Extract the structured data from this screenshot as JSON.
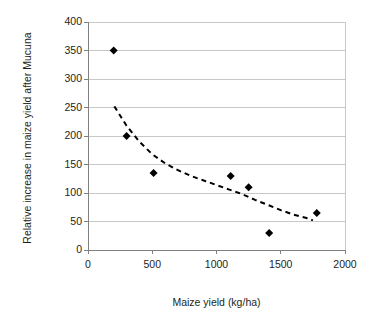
{
  "chart_data": {
    "type": "scatter",
    "title": "",
    "xlabel": "Maize yield (kg/ha)",
    "ylabel": "Relative increase in maize yield after Mucuna",
    "xlim": [
      0,
      2000
    ],
    "ylim": [
      0,
      400
    ],
    "xticks": [
      0,
      500,
      1000,
      1500,
      2000
    ],
    "yticks": [
      0,
      50,
      100,
      150,
      200,
      250,
      300,
      350,
      400
    ],
    "xtick_labels": [
      "0",
      "500",
      "1000",
      "1500",
      "2000"
    ],
    "ytick_labels": [
      "0",
      "50",
      "100",
      "150",
      "200",
      "250",
      "300",
      "350",
      "400"
    ],
    "grid": {
      "horizontal": true,
      "vertical": false,
      "color": "#c8c8c8"
    },
    "legend": {
      "visible": false,
      "position": "none"
    },
    "marker": {
      "shape": "diamond",
      "color": "#000000",
      "size": 7
    },
    "series": [
      {
        "name": "Relative increase in maize yield after Mucuna",
        "marker": "diamond",
        "color": "#000000",
        "points": [
          {
            "x": 200,
            "y": 350
          },
          {
            "x": 300,
            "y": 200
          },
          {
            "x": 510,
            "y": 135
          },
          {
            "x": 1110,
            "y": 130
          },
          {
            "x": 1250,
            "y": 110
          },
          {
            "x": 1410,
            "y": 30
          },
          {
            "x": 1780,
            "y": 65
          }
        ]
      }
    ],
    "trendline": {
      "name": "power-trendline",
      "style": "dashed",
      "color": "#000000",
      "dash_pattern": "5,4",
      "points": [
        {
          "x": 205,
          "y": 252
        },
        {
          "x": 300,
          "y": 218
        },
        {
          "x": 400,
          "y": 190
        },
        {
          "x": 500,
          "y": 168
        },
        {
          "x": 600,
          "y": 152
        },
        {
          "x": 700,
          "y": 140
        },
        {
          "x": 800,
          "y": 130
        },
        {
          "x": 900,
          "y": 122
        },
        {
          "x": 1000,
          "y": 114
        },
        {
          "x": 1100,
          "y": 106
        },
        {
          "x": 1200,
          "y": 98
        },
        {
          "x": 1300,
          "y": 88
        },
        {
          "x": 1400,
          "y": 79
        },
        {
          "x": 1500,
          "y": 70
        },
        {
          "x": 1600,
          "y": 62
        },
        {
          "x": 1700,
          "y": 56
        },
        {
          "x": 1750,
          "y": 52
        }
      ]
    },
    "axis": {
      "color": "#808080",
      "line_width": 1
    },
    "background": "#ffffff"
  }
}
